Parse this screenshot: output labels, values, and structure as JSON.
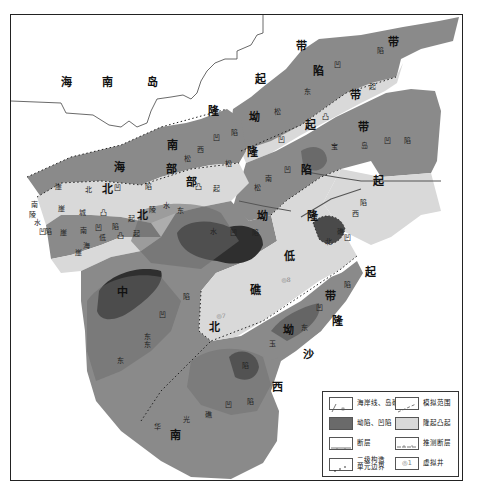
{
  "map": {
    "title_regions": {
      "hainan_island": [
        "海",
        "南",
        "岛"
      ]
    },
    "large_labels": [
      {
        "text": "海",
        "x": 66,
        "y": 82
      },
      {
        "text": "南",
        "x": 107,
        "y": 82
      },
      {
        "text": "岛",
        "x": 152,
        "y": 82
      },
      {
        "text": "带",
        "x": 301,
        "y": 46
      },
      {
        "text": "带",
        "x": 393,
        "y": 42
      },
      {
        "text": "起",
        "x": 260,
        "y": 79
      },
      {
        "text": "陷",
        "x": 318,
        "y": 71
      },
      {
        "text": "隆",
        "x": 213,
        "y": 111
      },
      {
        "text": "带",
        "x": 355,
        "y": 95
      },
      {
        "text": "坳",
        "x": 254,
        "y": 117
      },
      {
        "text": "起",
        "x": 310,
        "y": 125
      },
      {
        "text": "带",
        "x": 363,
        "y": 127
      },
      {
        "text": "南",
        "x": 172,
        "y": 145
      },
      {
        "text": "隆",
        "x": 252,
        "y": 152
      },
      {
        "text": "海",
        "x": 119,
        "y": 167
      },
      {
        "text": "部",
        "x": 171,
        "y": 169
      },
      {
        "text": "陷",
        "x": 306,
        "y": 170
      },
      {
        "text": "北",
        "x": 107,
        "y": 189
      },
      {
        "text": "部",
        "x": 191,
        "y": 182
      },
      {
        "text": "起",
        "x": 378,
        "y": 181
      },
      {
        "text": "北",
        "x": 142,
        "y": 215
      },
      {
        "text": "坳",
        "x": 262,
        "y": 216
      },
      {
        "text": "隆",
        "x": 312,
        "y": 216
      },
      {
        "text": "低",
        "x": 289,
        "y": 256
      },
      {
        "text": "起",
        "x": 370,
        "y": 272
      },
      {
        "text": "中",
        "x": 122,
        "y": 292
      },
      {
        "text": "礁",
        "x": 255,
        "y": 290
      },
      {
        "text": "带",
        "x": 330,
        "y": 296
      },
      {
        "text": "北",
        "x": 214,
        "y": 327
      },
      {
        "text": "隆",
        "x": 337,
        "y": 321
      },
      {
        "text": "坳",
        "x": 288,
        "y": 330
      },
      {
        "text": "沙",
        "x": 308,
        "y": 354
      },
      {
        "text": "西",
        "x": 277,
        "y": 387
      },
      {
        "text": "南",
        "x": 175,
        "y": 435
      }
    ],
    "small_labels": [
      {
        "text": "陷",
        "x": 380,
        "y": 51
      },
      {
        "text": "凹",
        "x": 337,
        "y": 65
      },
      {
        "text": "东",
        "x": 307,
        "y": 92
      },
      {
        "text": "起",
        "x": 372,
        "y": 87
      },
      {
        "text": "凸",
        "x": 325,
        "y": 117
      },
      {
        "text": "松",
        "x": 277,
        "y": 112
      },
      {
        "text": "宝",
        "x": 334,
        "y": 147
      },
      {
        "text": "岛",
        "x": 364,
        "y": 146
      },
      {
        "text": "凹",
        "x": 387,
        "y": 141
      },
      {
        "text": "陷",
        "x": 407,
        "y": 141
      },
      {
        "text": "凹",
        "x": 281,
        "y": 140
      },
      {
        "text": "陷",
        "x": 234,
        "y": 133
      },
      {
        "text": "凹",
        "x": 216,
        "y": 138
      },
      {
        "text": "西",
        "x": 200,
        "y": 150
      },
      {
        "text": "松",
        "x": 187,
        "y": 159
      },
      {
        "text": "松",
        "x": 228,
        "y": 164
      },
      {
        "text": "南",
        "x": 268,
        "y": 179
      },
      {
        "text": "凹",
        "x": 287,
        "y": 170
      },
      {
        "text": "松",
        "x": 257,
        "y": 188
      },
      {
        "text": "凸",
        "x": 198,
        "y": 187
      },
      {
        "text": "起",
        "x": 216,
        "y": 189
      },
      {
        "text": "崖",
        "x": 58,
        "y": 187
      },
      {
        "text": "北",
        "x": 88,
        "y": 190
      },
      {
        "text": "凹",
        "x": 117,
        "y": 188
      },
      {
        "text": "陷",
        "x": 148,
        "y": 187
      },
      {
        "text": "崖",
        "x": 61,
        "y": 209
      },
      {
        "text": "城",
        "x": 82,
        "y": 213
      },
      {
        "text": "凸",
        "x": 103,
        "y": 213
      },
      {
        "text": "起",
        "x": 131,
        "y": 219
      },
      {
        "text": "陵",
        "x": 152,
        "y": 210
      },
      {
        "text": "水",
        "x": 166,
        "y": 206
      },
      {
        "text": "崖",
        "x": 63,
        "y": 233
      },
      {
        "text": "南",
        "x": 83,
        "y": 231
      },
      {
        "text": "凹",
        "x": 98,
        "y": 228
      },
      {
        "text": "陷",
        "x": 115,
        "y": 227
      },
      {
        "text": "低",
        "x": 102,
        "y": 238
      },
      {
        "text": "凸",
        "x": 120,
        "y": 236
      },
      {
        "text": "起",
        "x": 136,
        "y": 234
      },
      {
        "text": "崖",
        "x": 78,
        "y": 253
      },
      {
        "text": "海",
        "x": 86,
        "y": 246
      },
      {
        "text": "南",
        "x": 34,
        "y": 205
      },
      {
        "text": "陵",
        "x": 32,
        "y": 215
      },
      {
        "text": "水",
        "x": 37,
        "y": 223
      },
      {
        "text": "凹",
        "x": 42,
        "y": 232
      },
      {
        "text": "陷",
        "x": 48,
        "y": 232
      },
      {
        "text": "东",
        "x": 180,
        "y": 211
      },
      {
        "text": "水",
        "x": 213,
        "y": 232
      },
      {
        "text": "凹",
        "x": 233,
        "y": 233
      },
      {
        "text": "陷",
        "x": 255,
        "y": 233
      },
      {
        "text": "礁",
        "x": 340,
        "y": 232
      },
      {
        "text": "凹",
        "x": 347,
        "y": 238
      },
      {
        "text": "北",
        "x": 328,
        "y": 242
      },
      {
        "text": "陷",
        "x": 363,
        "y": 203
      },
      {
        "text": "西",
        "x": 355,
        "y": 214
      },
      {
        "text": "陷",
        "x": 347,
        "y": 285
      },
      {
        "text": "凹",
        "x": 319,
        "y": 308
      },
      {
        "text": "东",
        "x": 304,
        "y": 328
      },
      {
        "text": "玉",
        "x": 272,
        "y": 344
      },
      {
        "text": "陷",
        "x": 186,
        "y": 297
      },
      {
        "text": "凹",
        "x": 162,
        "y": 315
      },
      {
        "text": "东",
        "x": 147,
        "y": 337
      },
      {
        "text": "东",
        "x": 120,
        "y": 361
      },
      {
        "text": "东",
        "x": 147,
        "y": 345
      },
      {
        "text": "陷",
        "x": 245,
        "y": 366
      },
      {
        "text": "凹",
        "x": 228,
        "y": 405
      },
      {
        "text": "陷",
        "x": 250,
        "y": 402
      },
      {
        "text": "光",
        "x": 186,
        "y": 420
      },
      {
        "text": "华",
        "x": 157,
        "y": 427
      },
      {
        "text": "礁",
        "x": 208,
        "y": 415
      }
    ],
    "well_labels": [
      {
        "text": "◎8",
        "x": 286,
        "y": 280
      },
      {
        "text": "◎7",
        "x": 221,
        "y": 316
      }
    ]
  },
  "legend": {
    "items": [
      {
        "key": "coastline",
        "label": "海岸线、岛礁"
      },
      {
        "key": "sim_range",
        "label": "模拟范围"
      },
      {
        "key": "depression",
        "label": "坳陷、凹陷"
      },
      {
        "key": "uplift",
        "label": "隆起凸起"
      },
      {
        "key": "fault",
        "label": "断层"
      },
      {
        "key": "inferred_fault",
        "label": "推测断层"
      },
      {
        "key": "unit_boundary",
        "label": "二级构造\n单元边界"
      },
      {
        "key": "virtual_well",
        "label": "虚拟井"
      }
    ],
    "virtual_well_symbol": "◎1"
  },
  "colors": {
    "frame": "#222222",
    "depression_mid": "#8a8a8a",
    "depression_deep": "#6a6a6a",
    "depression_darkest": "#2f2f2f",
    "uplift": "#d9d9d9",
    "sea": "#ffffff"
  }
}
